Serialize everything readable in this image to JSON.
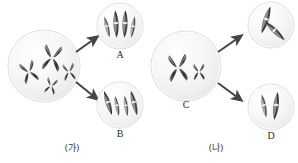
{
  "figure": {
    "title": "",
    "type": "cell-division-diagram",
    "background_color": "#ffffff",
    "cell_fill_color": "#f2f2f2",
    "cell_edge_color": "#d8d8d8",
    "chromosome_color": "#5a5a5a",
    "chromosome_dark_color": "#3b3b3b",
    "arrow_color": "#4a4a4a",
    "label_color": "#2b2b2b"
  },
  "panels": [
    {
      "id": "panel-ga",
      "label": "(가)",
      "parent_cell": {
        "name": "parent-cell-ga",
        "label": "",
        "chromosome_count": 4,
        "chromosome_shape": "X-shaped (duplicated, sister chromatids)"
      },
      "daughter_cells": [
        {
          "name": "daughter-cell-a",
          "label": "A",
          "chromosome_count": 4,
          "chromosome_shape": "rod (single chromatid)"
        },
        {
          "name": "daughter-cell-b",
          "label": "B",
          "chromosome_count": 4,
          "chromosome_shape": "rod (single chromatid)"
        }
      ]
    },
    {
      "id": "panel-na",
      "label": "(나)",
      "parent_cell": {
        "name": "parent-cell-c",
        "label": "C",
        "chromosome_count": 2,
        "chromosome_shape": "X-shaped (one large, one small)"
      },
      "daughter_cells": [
        {
          "name": "daughter-cell-upper-right",
          "label": "",
          "chromosome_count": 2,
          "chromosome_shape": "rod (single chromatid)"
        },
        {
          "name": "daughter-cell-d",
          "label": "D",
          "chromosome_count": 2,
          "chromosome_shape": "rod (single chromatid)"
        }
      ]
    }
  ],
  "labels": {
    "a": "A",
    "b": "B",
    "c": "C",
    "d": "D",
    "group_ga": "(가)",
    "group_na": "(나)"
  }
}
